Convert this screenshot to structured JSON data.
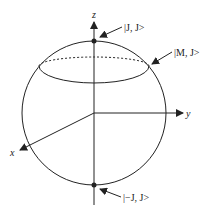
{
  "diagram": {
    "type": "bloch-sphere-angular-momentum",
    "axes": {
      "z": "z",
      "y": "y",
      "x": "x"
    },
    "states": {
      "top": "|J, J>",
      "latitude": "|M, J>",
      "bottom": "|−J, J>"
    },
    "colors": {
      "stroke": "#222222",
      "background": "#ffffff"
    }
  }
}
